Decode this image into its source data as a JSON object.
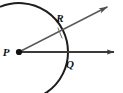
{
  "figure": {
    "background_color": "#ffffff",
    "width": 123,
    "height": 93,
    "labels": {
      "p": "P",
      "q": "Q",
      "r": "R"
    },
    "points": {
      "P": {
        "x": 19,
        "y": 52,
        "name": "vertex-point-p",
        "dot": true
      },
      "Q": {
        "x": 68,
        "y": 52,
        "name": "arc-intersection-q",
        "dot": false
      },
      "R": {
        "x": 60,
        "y": 30,
        "name": "arc-intersection-r",
        "dot": false
      }
    },
    "label_positions": {
      "p": {
        "x": 6,
        "y": 56
      },
      "q": {
        "x": 70,
        "y": 68
      },
      "r": {
        "x": 60,
        "y": 22
      }
    },
    "rays": [
      {
        "id": "horizontal-ray",
        "name": "ray-pq",
        "from": "P",
        "through": "Q",
        "start": {
          "x": 19,
          "y": 52
        },
        "end": {
          "x": 114,
          "y": 52
        },
        "color": "#3a3a3a",
        "stroke_width": 2.1,
        "arrowhead": true
      },
      {
        "id": "diagonal-ray",
        "name": "ray-pr",
        "from": "P",
        "through": "R",
        "start": {
          "x": 19,
          "y": 52
        },
        "end": {
          "x": 107,
          "y": 7
        },
        "color": "#5a5a5a",
        "stroke_width": 1.5,
        "arrowhead": true
      }
    ],
    "arc": {
      "id": "compass-arc",
      "name": "compass-arc",
      "center": {
        "x": 19,
        "y": 52
      },
      "radius": 49,
      "start_angle_deg": -112,
      "end_angle_deg": 112,
      "color": "#1d1d1d",
      "stroke_width": 2.0
    },
    "tick_mark": {
      "id": "intersection-tick",
      "name": "intersection-tick-mark",
      "x1": 58,
      "y1": 28,
      "x2": 62,
      "y2": 38,
      "color": "#6a6a6a",
      "stroke_width": 1.0
    },
    "colors": {
      "ink_dark": "#1d1d1d",
      "ink_medium": "#3a3a3a",
      "ink_light": "#5a5a5a",
      "paper": "#ffffff"
    }
  }
}
